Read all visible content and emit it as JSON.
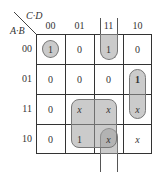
{
  "kmap": {
    "col_variable_label": "C·D",
    "row_variable_label": "A·B",
    "col_headers": [
      "00",
      "01",
      "11",
      "10"
    ],
    "row_headers": [
      "00",
      "01",
      "11",
      "10"
    ],
    "cells": [
      [
        "1",
        "0",
        "1",
        "0"
      ],
      [
        "0",
        "0",
        "0",
        "1"
      ],
      [
        "0",
        "x",
        "x",
        "x"
      ],
      [
        "0",
        "1",
        "x",
        "x"
      ]
    ],
    "groups": [
      {
        "name": "single-m0",
        "cells": [
          [
            0,
            0
          ]
        ],
        "shape": "circle"
      },
      {
        "name": "column-11-wrap",
        "cells": [
          [
            0,
            2
          ],
          [
            3,
            2
          ]
        ],
        "shape": "wraparound-vertical"
      },
      {
        "name": "quad-rows-11-10-cols-01-11",
        "cells": [
          [
            2,
            1
          ],
          [
            2,
            2
          ],
          [
            3,
            1
          ],
          [
            3,
            2
          ]
        ],
        "shape": "rounded-rect"
      },
      {
        "name": "pair-col-10-rows-01-11",
        "cells": [
          [
            1,
            3
          ],
          [
            2,
            3
          ]
        ],
        "shape": "pill-vertical"
      }
    ],
    "loop_color": "#a0a0a0",
    "grid_color": "#333333"
  }
}
